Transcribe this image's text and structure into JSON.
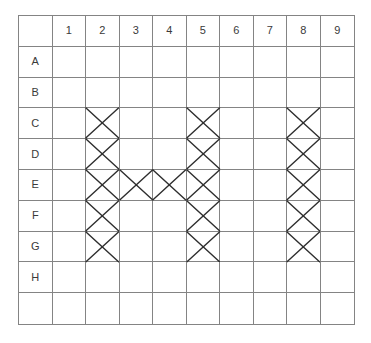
{
  "grid": {
    "column_headers": [
      "",
      "1",
      "2",
      "3",
      "4",
      "5",
      "6",
      "7",
      "8",
      "9"
    ],
    "row_labels": [
      "A",
      "B",
      "C",
      "D",
      "E",
      "F",
      "G",
      "H",
      ""
    ],
    "marked_cells": [
      "C2",
      "C5",
      "C8",
      "D2",
      "D5",
      "D8",
      "E2",
      "E3",
      "E4",
      "E5",
      "E8",
      "F2",
      "F5",
      "F8",
      "G2",
      "G5",
      "G8"
    ],
    "mark_symbol": "x-cross"
  },
  "colors": {
    "grid_line": "#848484",
    "mark_stroke": "#2e2e2e",
    "label_text": "#3a3a3a",
    "background": "#ffffff"
  }
}
